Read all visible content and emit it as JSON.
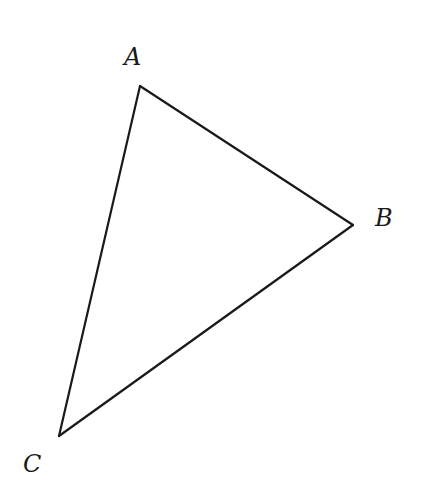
{
  "diagram": {
    "type": "triangle",
    "stroke_color": "#1a1a1a",
    "background": "#ffffff",
    "vertices": [
      {
        "name": "A",
        "label": "A",
        "x": 140,
        "y": 86,
        "label_x": 124,
        "label_y": 65
      },
      {
        "name": "B",
        "label": "B",
        "x": 353,
        "y": 225,
        "label_x": 375,
        "label_y": 226
      },
      {
        "name": "C",
        "label": "C",
        "x": 59,
        "y": 436,
        "label_x": 23,
        "label_y": 472
      }
    ],
    "edges": [
      {
        "from": "A",
        "to": "B"
      },
      {
        "from": "B",
        "to": "C"
      },
      {
        "from": "C",
        "to": "A"
      }
    ]
  }
}
